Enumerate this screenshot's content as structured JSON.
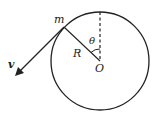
{
  "diagram": {
    "labels": {
      "mass": "m",
      "velocity": "v",
      "radius": "R",
      "angle": "θ",
      "center": "O"
    },
    "colors": {
      "stroke": "#222222",
      "background": "#ffffff"
    }
  }
}
